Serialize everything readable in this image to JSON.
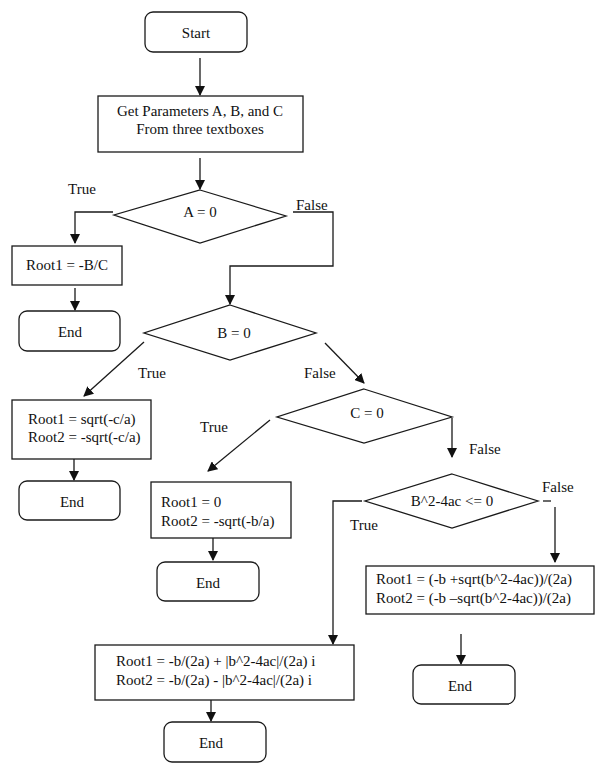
{
  "diagram": {
    "type": "flowchart",
    "nodes": {
      "start": {
        "shape": "terminator",
        "label": "Start"
      },
      "get_params": {
        "shape": "process",
        "lines": [
          "Get Parameters A, B, and C",
          "From three textboxes"
        ]
      },
      "a_zero": {
        "shape": "decision",
        "label": "A = 0"
      },
      "root_linear": {
        "shape": "process",
        "lines": [
          "Root1 = -B/C"
        ]
      },
      "end1": {
        "shape": "terminator",
        "label": "End"
      },
      "b_zero": {
        "shape": "decision",
        "label": "B = 0"
      },
      "roots_b0": {
        "shape": "process",
        "lines": [
          "Root1 = sqrt(-c/a)",
          "Root2 = -sqrt(-c/a)"
        ]
      },
      "end2": {
        "shape": "terminator",
        "label": "End"
      },
      "c_zero": {
        "shape": "decision",
        "label": "C = 0"
      },
      "roots_c0": {
        "shape": "process",
        "lines": [
          "Root1 = 0",
          "Root2 = -sqrt(-b/a)"
        ]
      },
      "end3": {
        "shape": "terminator",
        "label": "End"
      },
      "disc": {
        "shape": "decision",
        "label": "B^2-4ac <= 0"
      },
      "roots_real": {
        "shape": "process",
        "lines": [
          "Root1 = (-b +sqrt(b^2-4ac))/(2a)",
          "Root2 = (-b –sqrt(b^2-4ac))/(2a)"
        ]
      },
      "end4": {
        "shape": "terminator",
        "label": "End"
      },
      "roots_complex": {
        "shape": "process",
        "lines": [
          "Root1 = -b/(2a) + |b^2-4ac|/(2a) i",
          "Root2 = -b/(2a) - |b^2-4ac|/(2a) i"
        ]
      },
      "end5": {
        "shape": "terminator",
        "label": "End"
      }
    },
    "edge_labels": {
      "a_true": "True",
      "a_false": "False",
      "b_true": "True",
      "b_false": "False",
      "c_true": "True",
      "c_false": "False",
      "disc_true": "True",
      "disc_false": "False"
    },
    "edges": [
      {
        "from": "start",
        "to": "get_params"
      },
      {
        "from": "get_params",
        "to": "a_zero"
      },
      {
        "from": "a_zero",
        "to": "root_linear",
        "label": "True"
      },
      {
        "from": "a_zero",
        "to": "b_zero",
        "label": "False"
      },
      {
        "from": "root_linear",
        "to": "end1"
      },
      {
        "from": "b_zero",
        "to": "roots_b0",
        "label": "True"
      },
      {
        "from": "b_zero",
        "to": "c_zero",
        "label": "False"
      },
      {
        "from": "roots_b0",
        "to": "end2"
      },
      {
        "from": "c_zero",
        "to": "roots_c0",
        "label": "True"
      },
      {
        "from": "c_zero",
        "to": "disc",
        "label": "False"
      },
      {
        "from": "roots_c0",
        "to": "end3"
      },
      {
        "from": "disc",
        "to": "roots_complex",
        "label": "True"
      },
      {
        "from": "disc",
        "to": "roots_real",
        "label": "False"
      },
      {
        "from": "roots_real",
        "to": "end4"
      },
      {
        "from": "roots_complex",
        "to": "end5"
      }
    ]
  }
}
